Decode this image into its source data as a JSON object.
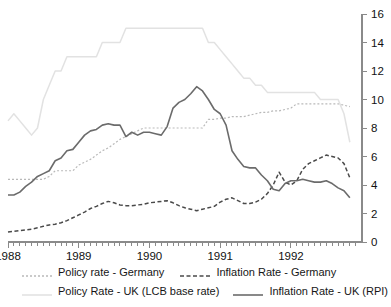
{
  "chart_data": {
    "type": "line",
    "title": "",
    "subtitle": "",
    "xlabel": "",
    "ylabel": "",
    "xlim": [
      1988.0,
      1992.92
    ],
    "ylim": [
      0,
      16
    ],
    "yticks": [
      0,
      2,
      4,
      6,
      8,
      10,
      12,
      14,
      16
    ],
    "ytick_labels": [
      "0",
      "2",
      "4",
      "6",
      "8",
      "10",
      "12",
      "14",
      "16"
    ],
    "xticks": [
      1988,
      1989,
      1990,
      1991,
      1992
    ],
    "xtick_labels": [
      "1988",
      "1989",
      "1990",
      "1991",
      "1992"
    ],
    "x_minor_ticks_per_year": 12,
    "grid": false,
    "legend_position": "below",
    "y_axis_side": "right",
    "x": [
      1988.0,
      1988.083,
      1988.167,
      1988.25,
      1988.333,
      1988.417,
      1988.5,
      1988.583,
      1988.667,
      1988.75,
      1988.833,
      1988.917,
      1989.0,
      1989.083,
      1989.167,
      1989.25,
      1989.333,
      1989.417,
      1989.5,
      1989.583,
      1989.667,
      1989.75,
      1989.833,
      1989.917,
      1990.0,
      1990.083,
      1990.167,
      1990.25,
      1990.333,
      1990.417,
      1990.5,
      1990.583,
      1990.667,
      1990.75,
      1990.833,
      1990.917,
      1991.0,
      1991.083,
      1991.167,
      1991.25,
      1991.333,
      1991.417,
      1991.5,
      1991.583,
      1991.667,
      1991.75,
      1991.833,
      1991.917,
      1992.0,
      1992.083,
      1992.167,
      1992.25,
      1992.333,
      1992.417,
      1992.5,
      1992.583,
      1992.667,
      1992.75,
      1992.833
    ],
    "series": [
      {
        "name": "Policy rate - Germany",
        "style": "dotted",
        "color": "#b9b9b9",
        "width": 1.2,
        "values": [
          4.4,
          4.4,
          4.4,
          4.4,
          4.4,
          4.4,
          4.4,
          4.6,
          5.0,
          5.0,
          5.0,
          5.0,
          5.4,
          5.6,
          5.8,
          6.1,
          6.4,
          6.6,
          6.9,
          7.2,
          7.4,
          7.6,
          7.8,
          8.0,
          8.0,
          8.0,
          8.0,
          8.0,
          8.0,
          8.0,
          8.0,
          8.0,
          8.0,
          8.0,
          8.6,
          8.6,
          8.7,
          8.7,
          8.8,
          8.8,
          8.8,
          8.9,
          9.0,
          9.1,
          9.1,
          9.2,
          9.2,
          9.3,
          9.4,
          9.7,
          9.7,
          9.7,
          9.7,
          9.7,
          9.7,
          9.7,
          9.7,
          9.6,
          9.5
        ]
      },
      {
        "name": "Inflation Rate - Germany",
        "style": "dashed",
        "color": "#4a4a4a",
        "width": 1.5,
        "values": [
          0.7,
          0.75,
          0.8,
          0.85,
          0.9,
          1.0,
          1.1,
          1.2,
          1.25,
          1.35,
          1.5,
          1.7,
          1.9,
          2.1,
          2.35,
          2.5,
          2.7,
          2.85,
          2.75,
          2.6,
          2.55,
          2.55,
          2.6,
          2.65,
          2.75,
          2.8,
          2.85,
          2.9,
          2.75,
          2.55,
          2.4,
          2.3,
          2.2,
          2.3,
          2.4,
          2.5,
          2.8,
          3.0,
          3.1,
          2.9,
          2.7,
          2.7,
          2.8,
          3.0,
          3.4,
          4.0,
          4.9,
          4.2,
          4.0,
          4.3,
          5.1,
          5.5,
          5.7,
          5.9,
          6.1,
          6.0,
          5.9,
          5.5,
          4.5
        ]
      },
      {
        "name": "Policy Rate - UK (LCB base rate)",
        "style": "solid",
        "color": "#e2e2e2",
        "width": 1.5,
        "values": [
          8.5,
          9.0,
          8.5,
          8.0,
          7.5,
          8.0,
          10.0,
          11.0,
          12.0,
          12.0,
          13.0,
          13.0,
          13.0,
          13.0,
          13.0,
          13.0,
          14.0,
          14.0,
          14.0,
          14.0,
          15.0,
          15.0,
          15.0,
          15.0,
          15.0,
          15.0,
          15.0,
          15.0,
          15.0,
          15.0,
          15.0,
          15.0,
          15.0,
          15.0,
          14.0,
          14.0,
          13.5,
          13.0,
          12.5,
          12.0,
          11.5,
          11.5,
          11.0,
          11.0,
          10.5,
          10.5,
          10.5,
          10.5,
          10.5,
          10.5,
          10.5,
          10.5,
          10.5,
          10.0,
          10.0,
          10.0,
          10.0,
          9.0,
          7.0
        ]
      },
      {
        "name": "Inflation Rate - UK (RPI)",
        "style": "solid",
        "color": "#6b6b6b",
        "width": 1.6,
        "values": [
          3.3,
          3.3,
          3.5,
          3.9,
          4.2,
          4.6,
          4.8,
          5.0,
          5.7,
          5.9,
          6.4,
          6.5,
          7.0,
          7.5,
          7.8,
          7.9,
          8.2,
          8.3,
          8.2,
          8.2,
          7.4,
          7.7,
          7.5,
          7.7,
          7.7,
          7.6,
          7.5,
          8.1,
          9.4,
          9.8,
          10.0,
          10.4,
          10.9,
          10.6,
          10.0,
          9.3,
          9.0,
          8.2,
          6.4,
          5.8,
          5.3,
          5.2,
          5.2,
          4.7,
          4.3,
          3.7,
          3.6,
          4.1,
          4.3,
          4.3,
          4.4,
          4.3,
          4.2,
          4.2,
          4.3,
          4.1,
          3.8,
          3.6,
          3.1
        ]
      }
    ]
  },
  "legend": {
    "items": [
      {
        "label": "Policy rate - Germany",
        "style": "dotted",
        "color": "#b9b9b9"
      },
      {
        "label": "Inflation Rate - Germany",
        "style": "dashed",
        "color": "#4a4a4a"
      },
      {
        "label": "Policy Rate - UK (LCB base rate)",
        "style": "solid",
        "color": "#e2e2e2"
      },
      {
        "label": "Inflation Rate - UK (RPI)",
        "style": "solid",
        "color": "#6b6b6b"
      }
    ]
  }
}
